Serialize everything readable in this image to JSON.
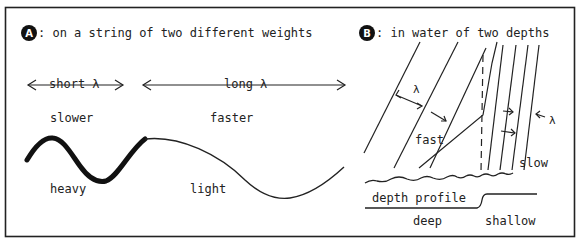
{
  "panel_a": {
    "badge": "A",
    "title": ":  on a string of two different weights",
    "short_lambda": "short λ",
    "long_lambda": "long λ",
    "slower": "slower",
    "faster": "faster",
    "heavy": "heavy",
    "light": "light"
  },
  "panel_b": {
    "badge": "B",
    "title": ":  in water of two depths",
    "lambda_fast": "λ",
    "lambda_slow": "λ",
    "fast": "fast",
    "slow": "slow",
    "depth_profile": "depth profile",
    "deep": "deep",
    "shallow": "shallow"
  },
  "colors": {
    "ink": "#222222",
    "background": "#ffffff"
  }
}
